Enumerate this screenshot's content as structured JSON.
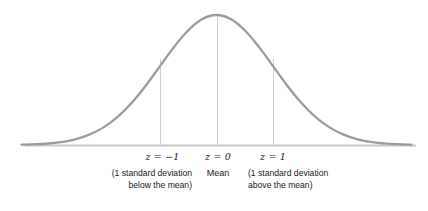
{
  "figure": {
    "type": "normal-distribution-curve",
    "background_color": "#ffffff",
    "curve_color": "#9b9b9b",
    "axis_color": "#c9c9c9",
    "gridline_color": "#cfcfcf",
    "text_color": "#1a1a1a"
  },
  "axis": {
    "baseline_y": 145,
    "x_start": 25,
    "x_end": 416
  },
  "markers": [
    {
      "id": "minus-one-sd",
      "x": 160,
      "z_prefix": "z",
      "z_operator": " = ",
      "z_value": "−1",
      "z_label": "z = −1",
      "caption_line1": "(1 standard deviation",
      "caption_line2": "below the mean)",
      "align": "right"
    },
    {
      "id": "mean",
      "x": 217,
      "z_prefix": "z",
      "z_operator": " = ",
      "z_value": "0",
      "z_label": "z = 0",
      "caption_line1": "Mean",
      "caption_line2": "",
      "align": "center"
    },
    {
      "id": "plus-one-sd",
      "x": 273,
      "z_prefix": "z",
      "z_operator": " = ",
      "z_value": "1",
      "z_label": "z = 1",
      "caption_line1": "(1 standard deviation",
      "caption_line2": "above the mean)",
      "align": "left"
    }
  ],
  "chart_data": {
    "type": "line",
    "title": "",
    "subtitle": "",
    "xlabel": "",
    "ylabel": "",
    "curve": "standard normal probability density",
    "mean": 0,
    "standard_deviation": 1,
    "xlim": [
      -3.45,
      3.55
    ],
    "ylim": [
      0,
      0.4
    ],
    "grid": false,
    "legend": null,
    "x": [
      -3.45,
      -3.2,
      -3.0,
      -2.75,
      -2.5,
      -2.25,
      -2.0,
      -1.75,
      -1.5,
      -1.25,
      -1.0,
      -0.75,
      -0.5,
      -0.25,
      0,
      0.25,
      0.5,
      0.75,
      1.0,
      1.25,
      1.5,
      1.75,
      2.0,
      2.25,
      2.5,
      2.75,
      3.0,
      3.2,
      3.45
    ],
    "y": [
      0.001,
      0.0024,
      0.0044,
      0.0091,
      0.0175,
      0.0317,
      0.054,
      0.0863,
      0.1295,
      0.1826,
      0.242,
      0.3011,
      0.3521,
      0.3867,
      0.3989,
      0.3867,
      0.3521,
      0.3011,
      0.242,
      0.1826,
      0.1295,
      0.0863,
      0.054,
      0.0317,
      0.0175,
      0.0091,
      0.0044,
      0.0024,
      0.001
    ],
    "annotations": [
      {
        "x": -1,
        "label": "z = −1",
        "note": "(1 standard deviation below the mean)"
      },
      {
        "x": 0,
        "label": "z = 0",
        "note": "Mean"
      },
      {
        "x": 1,
        "label": "z = 1",
        "note": "(1 standard deviation above the mean)"
      }
    ],
    "vertical_lines_at": [
      -1,
      0,
      1
    ]
  }
}
